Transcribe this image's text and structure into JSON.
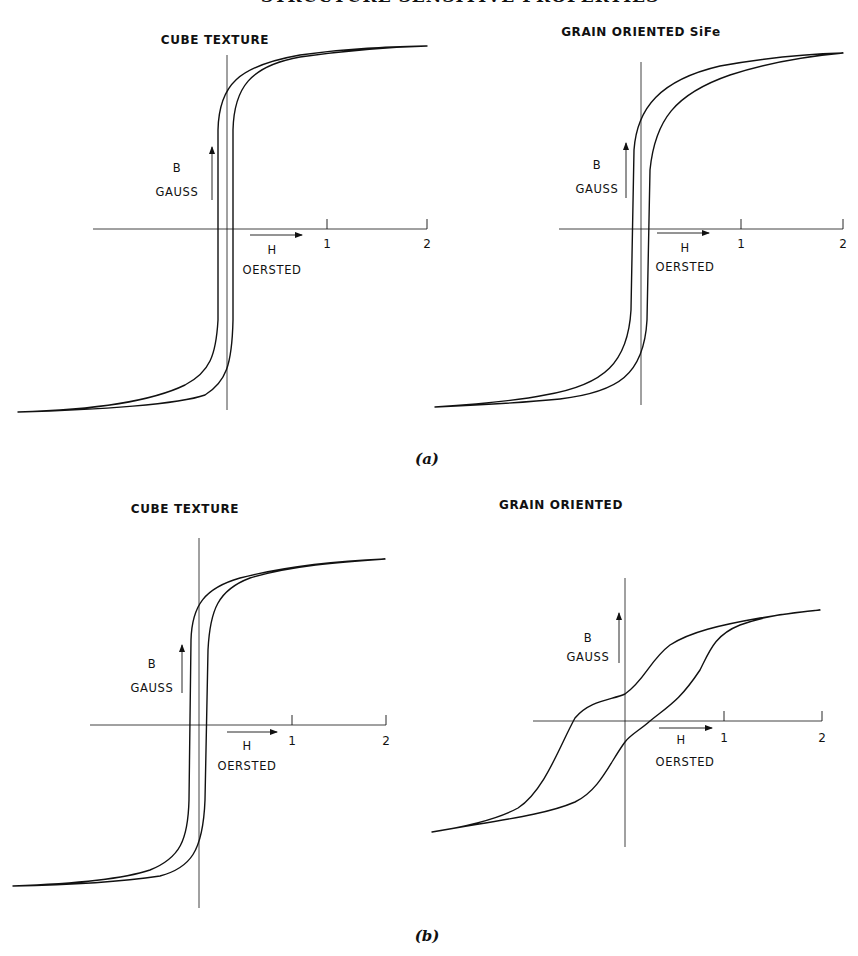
{
  "page": {
    "running_header": "STRUCTURE SENSITIVE PROPERTIES",
    "captions": [
      {
        "text": "(a)",
        "x": 427,
        "y": 450
      },
      {
        "text": "(b)",
        "x": 427,
        "y": 927
      }
    ]
  },
  "chart_data": [
    {
      "type": "line",
      "panel": "a",
      "title": "CUBE TEXTURE",
      "xlabel": "H OERSTED",
      "ylabel": "B GAUSS",
      "x_ticks": [
        "1",
        "2"
      ],
      "xlim": [
        -2.1,
        2
      ],
      "description": "Very square hysteresis loop; coercive force ~0.08 Oe; near-vertical branches; saturation reached by ~0.7 Oe",
      "series": [
        {
          "name": "ascending branch",
          "points": [
            [
              -2.1,
              -1.0
            ],
            [
              -0.7,
              -0.93
            ],
            [
              -0.2,
              -0.75
            ],
            [
              0.05,
              -0.6
            ],
            [
              0.07,
              0
            ],
            [
              0.1,
              0.72
            ],
            [
              0.3,
              0.9
            ],
            [
              0.75,
              0.97
            ],
            [
              2.0,
              1.0
            ]
          ]
        },
        {
          "name": "descending branch",
          "points": [
            [
              2.0,
              1.0
            ],
            [
              0.75,
              0.97
            ],
            [
              0.1,
              0.87
            ],
            [
              -0.05,
              0.75
            ],
            [
              -0.08,
              0
            ],
            [
              -0.1,
              -0.75
            ],
            [
              -0.3,
              -0.9
            ],
            [
              -0.7,
              -0.96
            ],
            [
              -2.1,
              -1.0
            ]
          ]
        }
      ],
      "geom": {
        "ox": 227,
        "oy": 229,
        "px_per_oe": 100,
        "axis_x0": 93,
        "axis_x1": 427,
        "axis_y0": 55,
        "axis_y1": 410,
        "tip_top": [
          427,
          46
        ],
        "tip_bottom": [
          18,
          412
        ],
        "title_pos": [
          215,
          44
        ],
        "b_label": [
          177,
          172
        ],
        "gauss_label": [
          177,
          196
        ],
        "b_arrow": [
          212,
          200,
          147
        ],
        "h_label": [
          272,
          254
        ],
        "oersted_label": [
          272,
          274
        ],
        "h_arrow": [
          250,
          302,
          235
        ],
        "tick_labels": [
          [
            327,
            248
          ],
          [
            427,
            248
          ]
        ]
      },
      "path_desc": "M18,412 C90,410 150,402 185,385 C210,372 216,355 218,320 L218,130 C219,85 238,66 300,55 C350,48 390,47 427,46 C390,47 350,50 300,57 C250,66 234,88 233,130 L233,320 C232,365 226,382 205,395 C180,404 100,410 18,412 Z"
    },
    {
      "type": "line",
      "panel": "a",
      "title": "GRAIN ORIENTED SiFe",
      "xlabel": "H OERSTED",
      "ylabel": "B GAUSS",
      "x_ticks": [
        "1",
        "2"
      ],
      "xlim": [
        -2.1,
        2
      ],
      "description": "Square loop, slightly more rounded knees than cube texture; coercive force ~0.07 Oe",
      "series": [
        {
          "name": "ascending branch",
          "points": [
            [
              -2.1,
              -1.0
            ],
            [
              -1.1,
              -0.96
            ],
            [
              -0.4,
              -0.8
            ],
            [
              0.03,
              -0.55
            ],
            [
              0.06,
              0
            ],
            [
              0.12,
              0.6
            ],
            [
              0.5,
              0.86
            ],
            [
              1.6,
              0.99
            ],
            [
              2.0,
              1.0
            ]
          ]
        },
        {
          "name": "descending branch",
          "points": [
            [
              2.0,
              1.0
            ],
            [
              1.6,
              0.99
            ],
            [
              0.5,
              0.92
            ],
            [
              0.0,
              0.6
            ],
            [
              -0.08,
              0
            ],
            [
              -0.12,
              -0.6
            ],
            [
              -0.5,
              -0.87
            ],
            [
              -1.1,
              -0.96
            ],
            [
              -2.1,
              -1.0
            ]
          ]
        }
      ],
      "geom": {
        "ox": 641,
        "oy": 229,
        "px_per_oe": 100,
        "axis_x0": 559,
        "axis_x1": 843,
        "axis_y0": 62,
        "axis_y1": 405,
        "tip_top": [
          843,
          53
        ],
        "tip_bottom": [
          435,
          407
        ],
        "title_pos": [
          641,
          36
        ],
        "b_label": [
          597,
          169
        ],
        "gauss_label": [
          597,
          193
        ],
        "b_arrow": [
          626,
          198,
          143
        ],
        "h_label": [
          685,
          252
        ],
        "oersted_label": [
          685,
          271
        ],
        "h_arrow": [
          657,
          709,
          233
        ],
        "tick_labels": [
          [
            741,
            248
          ],
          [
            843,
            248
          ]
        ]
      },
      "path_desc": "M435,407 C480,404 515,401 545,395 C605,385 628,362 631,310 L634,150 C637,108 660,80 720,66 C770,57 810,54 843,53 C810,56 770,62 730,75 C675,94 655,120 650,170 L647,320 C644,375 618,392 560,399 C520,403 480,405 435,407 Z"
    },
    {
      "type": "line",
      "panel": "b",
      "title": "CUBE TEXTURE",
      "xlabel": "H OERSTED",
      "ylabel": "B GAUSS",
      "x_ticks": [
        "1",
        "2"
      ],
      "xlim": [
        -2.0,
        2
      ],
      "description": "Square loop with rounded knees; coercive force ~0.08 Oe",
      "series": [
        {
          "name": "ascending branch",
          "points": [
            [
              -2.0,
              -1.0
            ],
            [
              -1.0,
              -0.95
            ],
            [
              -0.3,
              -0.8
            ],
            [
              0.03,
              -0.6
            ],
            [
              0.05,
              0
            ],
            [
              0.12,
              0.68
            ],
            [
              0.5,
              0.9
            ],
            [
              1.9,
              1.0
            ]
          ]
        },
        {
          "name": "descending branch",
          "points": [
            [
              1.9,
              1.0
            ],
            [
              0.5,
              0.94
            ],
            [
              0.0,
              0.75
            ],
            [
              -0.1,
              0
            ],
            [
              -0.15,
              -0.68
            ],
            [
              -0.5,
              -0.9
            ],
            [
              -2.0,
              -1.0
            ]
          ]
        }
      ],
      "geom": {
        "ox": 199,
        "oy": 725,
        "px_per_oe": 94,
        "axis_x0": 90,
        "axis_x1": 386,
        "axis_y0": 538,
        "axis_y1": 908,
        "tip_top": [
          385,
          559
        ],
        "tip_bottom": [
          13,
          886
        ],
        "title_pos": [
          185,
          513
        ],
        "b_label": [
          152,
          668
        ],
        "gauss_label": [
          152,
          692
        ],
        "b_arrow": [
          182,
          693,
          645
        ],
        "h_label": [
          247,
          750
        ],
        "oersted_label": [
          247,
          770
        ],
        "h_arrow": [
          227,
          277,
          732
        ],
        "tick_labels": [
          [
            292,
            745
          ],
          [
            386,
            745
          ]
        ]
      },
      "path_desc": "M13,886 C70,884 120,880 150,870 C180,858 188,840 189,800 L191,640 C192,605 205,588 240,578 C290,565 340,561 385,559 C340,562 290,566 250,578 C218,590 210,610 208,650 L205,800 C203,852 190,868 160,876 C120,882 70,885 13,886 Z"
    },
    {
      "type": "line",
      "panel": "b",
      "title": "GRAIN ORIENTED",
      "xlabel": "H OERSTED",
      "ylabel": "B GAUSS",
      "x_ticks": [
        "1",
        "2"
      ],
      "xlim": [
        -2.0,
        2
      ],
      "description": "Sheared, broad loop; coercive force ~0.3 Oe; remanence low; sigmoidal branches",
      "series": [
        {
          "name": "ascending branch",
          "points": [
            [
              -1.95,
              -1.0
            ],
            [
              -1.0,
              -0.93
            ],
            [
              -0.3,
              -0.8
            ],
            [
              0.0,
              -0.2
            ],
            [
              0.25,
              0
            ],
            [
              0.6,
              0.35
            ],
            [
              0.9,
              0.75
            ],
            [
              1.95,
              1.0
            ]
          ]
        },
        {
          "name": "descending branch",
          "points": [
            [
              1.95,
              1.0
            ],
            [
              1.0,
              0.95
            ],
            [
              0.4,
              0.8
            ],
            [
              0.0,
              0.24
            ],
            [
              -0.28,
              0
            ],
            [
              -0.6,
              -0.35
            ],
            [
              -1.0,
              -0.75
            ],
            [
              -1.95,
              -1.0
            ]
          ]
        }
      ],
      "geom": {
        "ox": 625,
        "oy": 721,
        "px_per_oe": 98,
        "axis_x0": 533,
        "axis_x1": 822,
        "axis_y0": 578,
        "axis_y1": 847,
        "tip_top": [
          820,
          610
        ],
        "tip_bottom": [
          432,
          832
        ],
        "title_pos": [
          561,
          509
        ],
        "b_label": [
          588,
          642
        ],
        "gauss_label": [
          588,
          661
        ],
        "b_arrow": [
          619,
          663,
          613
        ],
        "h_label": [
          681,
          744
        ],
        "oersted_label": [
          685,
          766
        ],
        "h_arrow": [
          659,
          712,
          728
        ],
        "tick_labels": [
          [
            724,
            742
          ],
          [
            822,
            742
          ]
        ]
      },
      "path_desc": "M432,832 C470,826 500,818 518,808 C545,790 560,745 575,718 C590,700 612,700 625,694 C645,680 650,660 670,645 C690,632 720,625 760,618 C790,613 808,611 820,610 C800,612 770,614 740,625 C715,635 710,650 700,670 C680,700 670,705 650,721 C640,730 630,735 625,742 C610,762 600,790 575,802 C545,815 500,820 432,832 Z"
    }
  ],
  "style": {
    "ink": "#111111",
    "paper": "#ffffff",
    "axis_stroke_width": 0.8,
    "curve_stroke_width": 1.4
  }
}
